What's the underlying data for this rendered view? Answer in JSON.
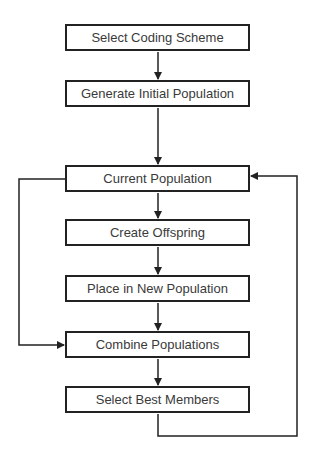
{
  "diagram": {
    "type": "flowchart",
    "stroke_color": "#222222",
    "text_color": "#3a3a3a",
    "nodes": [
      {
        "id": "n1",
        "label": "Select Coding Scheme",
        "top": 24
      },
      {
        "id": "n2",
        "label": "Generate Initial Population",
        "top": 80
      },
      {
        "id": "n3",
        "label": "Current Population",
        "top": 165
      },
      {
        "id": "n4",
        "label": "Create Offspring",
        "top": 219
      },
      {
        "id": "n5",
        "label": "Place in New Population",
        "top": 275
      },
      {
        "id": "n6",
        "label": "Combine Populations",
        "top": 331
      },
      {
        "id": "n7",
        "label": "Select Best Members",
        "top": 386
      }
    ],
    "edges": [
      {
        "from": "Select Coding Scheme",
        "to": "Generate Initial Population"
      },
      {
        "from": "Generate Initial Population",
        "to": "Current Population"
      },
      {
        "from": "Current Population",
        "to": "Create Offspring"
      },
      {
        "from": "Create Offspring",
        "to": "Place in New Population"
      },
      {
        "from": "Place in New Population",
        "to": "Combine Populations"
      },
      {
        "from": "Current Population",
        "to": "Combine Populations",
        "route": "left-loop"
      },
      {
        "from": "Combine Populations",
        "to": "Select Best Members"
      },
      {
        "from": "Select Best Members",
        "to": "Current Population",
        "route": "right-loop"
      }
    ]
  }
}
